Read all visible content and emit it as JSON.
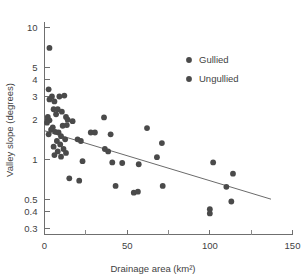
{
  "chart_data": {
    "type": "scatter",
    "title": "",
    "xlabel": "Drainage area (km²)",
    "ylabel": "Valley slope (degrees)",
    "xlim": [
      0,
      150
    ],
    "ylim": [
      0.27,
      11
    ],
    "yscale": "log",
    "xscale": "linear",
    "grid": false,
    "legend_position": "upper-right",
    "xticks": [
      0,
      50,
      100,
      150
    ],
    "xtick_labels": [
      "0",
      "50",
      "100",
      "150"
    ],
    "xticks_minor": [
      25,
      75,
      125
    ],
    "yticks": [
      0.3,
      0.4,
      0.5,
      1,
      2,
      3,
      4,
      5,
      10
    ],
    "ytick_labels": [
      "0.3",
      "0.4",
      "0.5",
      "1",
      "2",
      "3",
      "4",
      "5",
      "10"
    ],
    "series": [
      {
        "name": "Gullied",
        "marker": "filled-circle",
        "color": "#4a4a4a",
        "points": [
          [
            3.0,
            7.0
          ],
          [
            2.5,
            3.4
          ],
          [
            4.5,
            3.0
          ],
          [
            9.0,
            3.0
          ],
          [
            12.0,
            3.05
          ],
          [
            3.0,
            2.85
          ],
          [
            6.0,
            2.75
          ],
          [
            5.5,
            2.4
          ],
          [
            8.0,
            2.4
          ],
          [
            10.5,
            2.3
          ],
          [
            7.0,
            2.2
          ],
          [
            2.0,
            2.1
          ],
          [
            2.0,
            2.0
          ],
          [
            3.0,
            1.98
          ],
          [
            1.5,
            1.9
          ],
          [
            13.0,
            2.1
          ],
          [
            14.0,
            2.0
          ],
          [
            17.0,
            1.95
          ],
          [
            13.5,
            1.82
          ],
          [
            11.0,
            1.8
          ],
          [
            5.0,
            1.75
          ],
          [
            4.0,
            1.68
          ],
          [
            6.5,
            1.62
          ],
          [
            8.5,
            1.6
          ],
          [
            2.5,
            1.55
          ],
          [
            10.0,
            1.5
          ],
          [
            12.5,
            1.42
          ],
          [
            7.5,
            1.38
          ],
          [
            9.5,
            1.3
          ],
          [
            5.5,
            1.25
          ],
          [
            11.5,
            1.2
          ],
          [
            8.0,
            1.15
          ],
          [
            13.0,
            1.12
          ],
          [
            6.0,
            1.08
          ],
          [
            10.0,
            1.05
          ],
          [
            36.0,
            2.08
          ],
          [
            62.0,
            1.73
          ],
          [
            28.0,
            1.6
          ],
          [
            30.5,
            1.6
          ],
          [
            20.0,
            1.42
          ],
          [
            22.0,
            1.38
          ],
          [
            40.0,
            1.55
          ],
          [
            71.0,
            1.33
          ],
          [
            36.5,
            1.2
          ],
          [
            38.5,
            1.15
          ],
          [
            68.0,
            1.04
          ],
          [
            23.0,
            0.97
          ],
          [
            41.0,
            0.95
          ],
          [
            47.0,
            0.94
          ],
          [
            57.0,
            0.92
          ],
          [
            102.0,
            0.95
          ],
          [
            114.0,
            0.78
          ],
          [
            15.0,
            0.72
          ],
          [
            21.0,
            0.69
          ],
          [
            43.0,
            0.63
          ],
          [
            71.5,
            0.63
          ],
          [
            110.0,
            0.62
          ],
          [
            54.0,
            0.56
          ],
          [
            56.5,
            0.57
          ],
          [
            113.0,
            0.48
          ],
          [
            100.0,
            0.42
          ],
          [
            100.0,
            0.39
          ]
        ]
      }
    ],
    "trendline": {
      "x_start": 0,
      "y_start": 1.65,
      "x_end": 137,
      "y_end": 0.5,
      "color": "#6b6b6b"
    }
  },
  "legend": {
    "entries": [
      {
        "label": "Gullied",
        "color": "#4a4a4a"
      },
      {
        "label": "Ungullied",
        "color": "#4a4a4a"
      }
    ]
  },
  "axes": {
    "x_title": "Drainage area (km²)",
    "y_title": "Valley slope (degrees)"
  }
}
